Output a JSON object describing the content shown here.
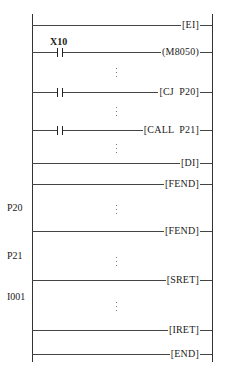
{
  "diagram": {
    "type": "PLC ladder diagram",
    "rungs": [
      {
        "id": "ei",
        "instruction": "[EI]",
        "contact": null
      },
      {
        "id": "m8050",
        "instruction": "(M8050)",
        "contact": "X10"
      },
      {
        "id": "cj",
        "instruction": "[CJ  P20]",
        "contact": ""
      },
      {
        "id": "call",
        "instruction": "[CALL  P21]",
        "contact": ""
      },
      {
        "id": "di",
        "instruction": "[DI]",
        "contact": null
      },
      {
        "id": "fend1",
        "instruction": "[FEND]",
        "contact": null
      },
      {
        "id": "fend2",
        "instruction": "[FEND]",
        "contact": null
      },
      {
        "id": "sret",
        "instruction": "[SRET]",
        "contact": null
      },
      {
        "id": "iret",
        "instruction": "[IRET]",
        "contact": null
      },
      {
        "id": "end",
        "instruction": "[END]",
        "contact": null
      }
    ],
    "pointer_labels": {
      "p20": "P20",
      "p21": "P21",
      "i001": "I001"
    },
    "contact_labels": {
      "x10": "X10"
    },
    "ellipsis": "⋮"
  }
}
